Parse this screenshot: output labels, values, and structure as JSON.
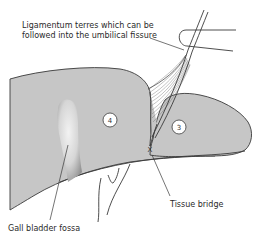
{
  "figure": {
    "type": "anatomical-diagram"
  },
  "labels": {
    "ligamentum": {
      "line1": "Ligamentum terres which can be",
      "line2": "followed into the umbilical fissure"
    },
    "tissue_bridge": "Tissue bridge",
    "gall_bladder": "Gall bladder fossa"
  },
  "segments": [
    {
      "id": "segment-4",
      "label": "4"
    },
    {
      "id": "segment-3",
      "label": "3"
    }
  ],
  "markers": {
    "tissue_bridge_mark": "X"
  },
  "colors": {
    "liver_fill": "#c6c6c6",
    "outline": "#3a3a3a",
    "fossa_light": "#ececec",
    "fossa_dark": "#9a9a9a",
    "badge_fill": "#ffffff",
    "background": "#ffffff"
  }
}
